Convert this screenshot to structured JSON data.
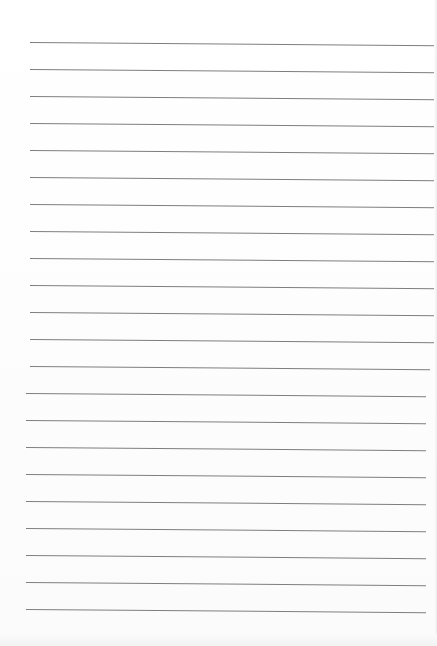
{
  "document": {
    "type": "lined-paper",
    "line_count": 22,
    "line_color": "#7e7e7e",
    "background_color": "#ffffff",
    "first_line_y": 42,
    "line_spacing": 27,
    "line_left_x": 30,
    "line_right_x": 437
  }
}
